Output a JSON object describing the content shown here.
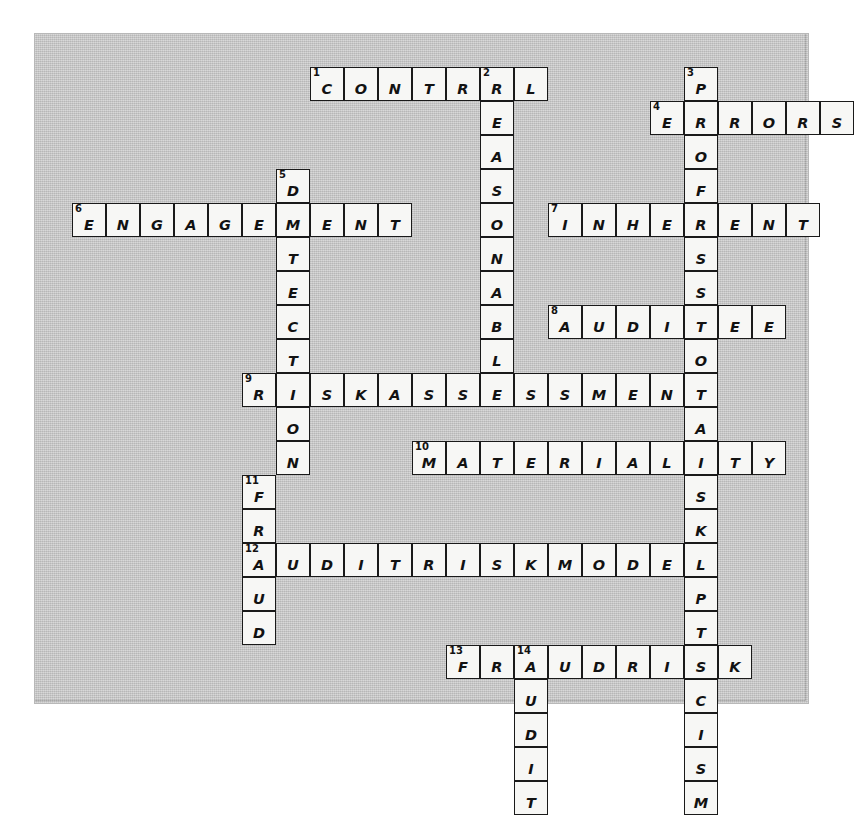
{
  "puzzle": {
    "title": "Audit Terminology Crossword",
    "cell_size": 34,
    "origin": {
      "x": 37,
      "y": 33
    },
    "colors": {
      "paper": "#c9c9c9",
      "cell_fill": "#f7f7f5",
      "cell_border": "#1a1a1a",
      "text": "#121212"
    },
    "grid_cols": 22,
    "grid_rows": 20,
    "entries": [
      {
        "number": 1,
        "direction": "across",
        "answer": "CONTROL",
        "col": 7,
        "row": 0,
        "length": 7
      },
      {
        "number": 2,
        "direction": "down",
        "answer": "REASONABLE",
        "col": 12,
        "row": 0,
        "length": 10
      },
      {
        "number": 3,
        "direction": "down",
        "answer": "PROFESSIONALSKEPTICISM",
        "col": 18,
        "row": 0,
        "length": 22
      },
      {
        "number": 4,
        "direction": "across",
        "answer": "ERRORS",
        "col": 17,
        "row": 1,
        "length": 6
      },
      {
        "number": 5,
        "direction": "down",
        "answer": "DETECTION",
        "col": 6,
        "row": 3,
        "length": 9
      },
      {
        "number": 6,
        "direction": "across",
        "answer": "ENGAGEMENT",
        "col": 0,
        "row": 4,
        "length": 10
      },
      {
        "number": 7,
        "direction": "across",
        "answer": "INHERENT",
        "col": 14,
        "row": 4,
        "length": 8
      },
      {
        "number": 8,
        "direction": "across",
        "answer": "AUDITEE",
        "col": 14,
        "row": 7,
        "length": 7
      },
      {
        "number": 9,
        "direction": "across",
        "answer": "RISKASSESSMENT",
        "col": 5,
        "row": 9,
        "length": 14
      },
      {
        "number": 10,
        "direction": "across",
        "answer": "MATERIALITY",
        "col": 10,
        "row": 11,
        "length": 11
      },
      {
        "number": 11,
        "direction": "down",
        "answer": "FRAUD",
        "col": 5,
        "row": 12,
        "length": 5
      },
      {
        "number": 12,
        "direction": "across",
        "answer": "AUDITRISKMODEL",
        "col": 5,
        "row": 14,
        "length": 14
      },
      {
        "number": 13,
        "direction": "across",
        "answer": "FRAUDRISK",
        "col": 11,
        "row": 17,
        "length": 9
      },
      {
        "number": 14,
        "direction": "down",
        "answer": "AUDIT",
        "col": 13,
        "row": 17,
        "length": 5
      }
    ]
  }
}
